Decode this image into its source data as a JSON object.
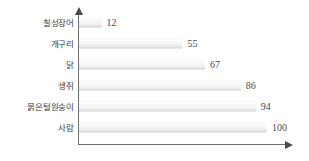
{
  "chart_data": {
    "type": "bar",
    "orientation": "horizontal",
    "title": "",
    "subtitle": "",
    "xlabel": "",
    "ylabel": "",
    "xlim": [
      0,
      100
    ],
    "grid": false,
    "legend": false,
    "categories": [
      "칠성장어",
      "개구리",
      "닭",
      "생쥐",
      "붉은털원숭이",
      "사람"
    ],
    "values": [
      12,
      55,
      67,
      86,
      94,
      100
    ],
    "value_labels": [
      "12",
      "55",
      "67",
      "86",
      "94",
      "100"
    ],
    "axis": {
      "y_arrow": "up-arrow-icon",
      "x_arrow": "right-arrow-icon"
    },
    "colors": {
      "bar_fill_light": "#f7f7f7",
      "bar_fill_dark": "#cfcfcf",
      "axis": "#6f6f6f",
      "text": "#3a3a3a",
      "value_text": "#4a4a4a",
      "background": "#ffffff"
    }
  }
}
